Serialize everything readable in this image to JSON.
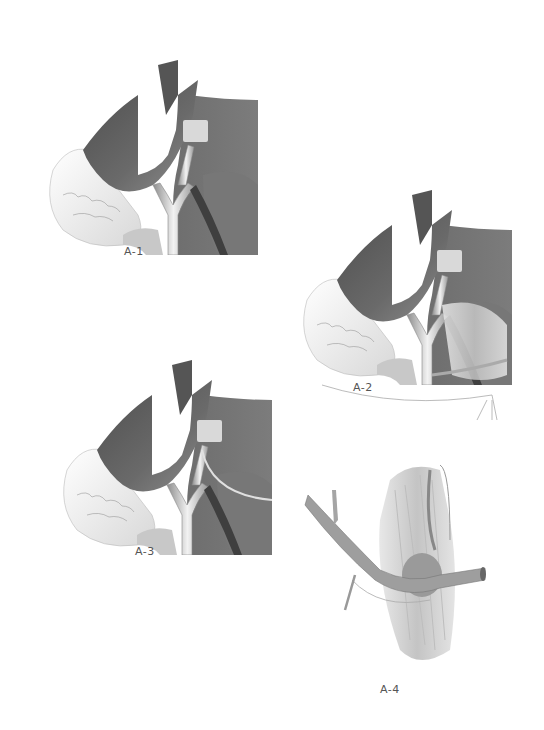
{
  "figure": {
    "background": "#ffffff",
    "panels": [
      {
        "id": "A-1",
        "label": "A-1"
      },
      {
        "id": "A-2",
        "label": "A-2"
      },
      {
        "id": "A-3",
        "label": "A-3"
      },
      {
        "id": "A-4",
        "label": "A-4"
      }
    ],
    "colors": {
      "dark_tissue": "#5f5f5f",
      "mid_tissue": "#8a8a8a",
      "light_tissue": "#d9d9d9",
      "vessel": "#b5b5b5",
      "vessel_highlight": "#efefef",
      "outline": "#9a9a9a",
      "label_text": "#555555"
    }
  }
}
